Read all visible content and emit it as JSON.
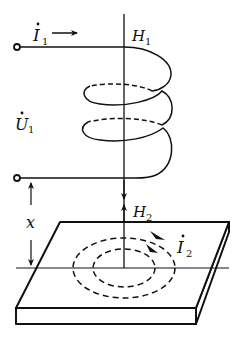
{
  "diagram": {
    "type": "eddy-current induction schematic",
    "labels": {
      "current1": {
        "symbol": "I",
        "subscript": "1",
        "dot": true
      },
      "voltage1": {
        "symbol": "U",
        "subscript": "1",
        "dot": true
      },
      "field1": {
        "symbol": "H",
        "subscript": "1"
      },
      "field2": {
        "symbol": "H",
        "subscript": "2"
      },
      "current2": {
        "symbol": "I",
        "subscript": "2",
        "dot": true
      },
      "distance": {
        "symbol": "x"
      }
    },
    "components": [
      {
        "name": "excitation-coil",
        "turns": 3
      },
      {
        "name": "conductive-plate"
      },
      {
        "name": "eddy-current-loops",
        "count": 2
      }
    ],
    "colors": {
      "ink": "#111111",
      "background": "#ffffff"
    }
  }
}
